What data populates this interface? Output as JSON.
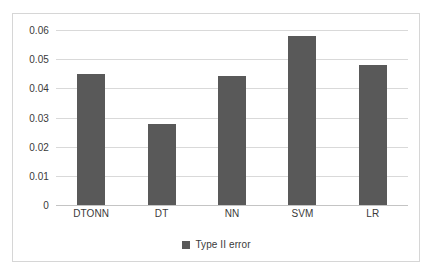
{
  "chart_data": {
    "type": "bar",
    "title": "",
    "subtitle": "",
    "xlabel": "",
    "ylabel": "",
    "categories": [
      "DTONN",
      "DT",
      "NN",
      "SVM",
      "LR"
    ],
    "series": [
      {
        "name": "Type II error",
        "values": [
          0.045,
          0.0278,
          0.0442,
          0.058,
          0.048
        ],
        "color": "#595959"
      }
    ],
    "yticks": [
      "0",
      "0.01",
      "0.02",
      "0.03",
      "0.04",
      "0.05",
      "0.06"
    ],
    "ytick_values": [
      0,
      0.01,
      0.02,
      0.03,
      0.04,
      0.05,
      0.06
    ],
    "ylim": [
      0,
      0.06
    ],
    "grid": true,
    "grid_axis": "y",
    "legend": {
      "position": "bottom",
      "entries": [
        {
          "label": "Type II error",
          "color": "#595959",
          "marker": "square-swatch"
        }
      ]
    },
    "frame_color": "#d6d6d6",
    "gridline_color": "#d9d9d9",
    "text_color": "#3a3a3a",
    "background": "#ffffff"
  }
}
